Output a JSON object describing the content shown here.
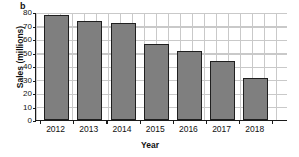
{
  "figure": {
    "panel_label": "b",
    "background_color": "#ffffff"
  },
  "chart_data": {
    "type": "bar",
    "title": "",
    "panel": "b",
    "xlabel": "Year",
    "ylabel": "Sales (millions)",
    "categories": [
      "2012",
      "2013",
      "2014",
      "2015",
      "2016",
      "2017",
      "2018"
    ],
    "values": [
      78,
      73,
      72,
      56,
      51,
      43.5,
      31
    ],
    "ylim": [
      0,
      80
    ],
    "ytick_labels": [
      "0",
      "10",
      "20",
      "30",
      "40",
      "50",
      "60",
      "70",
      "80"
    ],
    "ytick_values": [
      0,
      10,
      20,
      30,
      40,
      50,
      60,
      70,
      80
    ],
    "grid": true,
    "legend": "none",
    "bar_color": "#7f7f7f",
    "bar_edge_color": "#1f1f1f",
    "grid_color": "#c9c9c9",
    "axis_color": "#1a1a1a"
  }
}
